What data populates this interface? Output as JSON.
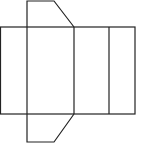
{
  "diagram": {
    "type": "prism-net",
    "stroke_color": "#222222",
    "background": "#ffffff",
    "top_flap": [
      [
        27,
        1
      ],
      [
        54,
        1
      ],
      [
        74,
        27
      ],
      [
        27,
        27
      ]
    ],
    "bottom_flap": [
      [
        27,
        114
      ],
      [
        74,
        114
      ],
      [
        54,
        142
      ],
      [
        27,
        142
      ]
    ],
    "main_rect": {
      "x": 0,
      "y": 27,
      "width": 135,
      "height": 87
    },
    "fold_lines_x": [
      27,
      74,
      109
    ]
  }
}
